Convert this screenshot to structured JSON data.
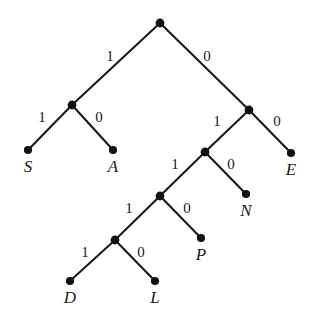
{
  "figure": {
    "kind": "binary-coding-tree",
    "background_color": "#ffffff",
    "line_color": "#1a1a1a",
    "node_color": "#111111",
    "width": 315,
    "height": 328
  },
  "chart_data": {
    "type": "diagram",
    "subtype": "binary-tree",
    "title": "",
    "nodes": [
      {
        "id": "root",
        "kind": "internal",
        "x": 160,
        "y": 23,
        "label": ""
      },
      {
        "id": "n_1",
        "kind": "internal",
        "x": 72,
        "y": 105,
        "label": ""
      },
      {
        "id": "n_0",
        "kind": "internal",
        "x": 249,
        "y": 110,
        "label": ""
      },
      {
        "id": "n_01",
        "kind": "internal",
        "x": 205,
        "y": 152,
        "label": ""
      },
      {
        "id": "n_011",
        "kind": "internal",
        "x": 160,
        "y": 196,
        "label": ""
      },
      {
        "id": "n_0111",
        "kind": "internal",
        "x": 115,
        "y": 240,
        "label": ""
      },
      {
        "id": "leaf_S",
        "kind": "leaf",
        "x": 28,
        "y": 150,
        "label": "S"
      },
      {
        "id": "leaf_A",
        "kind": "leaf",
        "x": 113,
        "y": 150,
        "label": "A"
      },
      {
        "id": "leaf_E",
        "kind": "leaf",
        "x": 291,
        "y": 153,
        "label": "E"
      },
      {
        "id": "leaf_N",
        "kind": "leaf",
        "x": 246,
        "y": 194,
        "label": "N"
      },
      {
        "id": "leaf_P",
        "kind": "leaf",
        "x": 201,
        "y": 238,
        "label": "P"
      },
      {
        "id": "leaf_D",
        "kind": "leaf",
        "x": 70,
        "y": 281,
        "label": "D"
      },
      {
        "id": "leaf_L",
        "kind": "leaf",
        "x": 155,
        "y": 281,
        "label": "L"
      }
    ],
    "edges": [
      {
        "from": "root",
        "to": "n_1",
        "bit": "1",
        "label_x": 110,
        "label_y": 56
      },
      {
        "from": "root",
        "to": "n_0",
        "bit": "0",
        "label_x": 207,
        "label_y": 56
      },
      {
        "from": "n_1",
        "to": "leaf_S",
        "bit": "1",
        "label_x": 42,
        "label_y": 117
      },
      {
        "from": "n_1",
        "to": "leaf_A",
        "bit": "0",
        "label_x": 99,
        "label_y": 117
      },
      {
        "from": "n_0",
        "to": "n_01",
        "bit": "1",
        "label_x": 217,
        "label_y": 121
      },
      {
        "from": "n_0",
        "to": "leaf_E",
        "bit": "0",
        "label_x": 277,
        "label_y": 121
      },
      {
        "from": "n_01",
        "to": "n_011",
        "bit": "1",
        "label_x": 175,
        "label_y": 164
      },
      {
        "from": "n_01",
        "to": "leaf_N",
        "bit": "0",
        "label_x": 231,
        "label_y": 164
      },
      {
        "from": "n_011",
        "to": "n_0111",
        "bit": "1",
        "label_x": 129,
        "label_y": 208
      },
      {
        "from": "n_011",
        "to": "leaf_P",
        "bit": "0",
        "label_x": 187,
        "label_y": 208
      },
      {
        "from": "n_0111",
        "to": "leaf_D",
        "bit": "1",
        "label_x": 85,
        "label_y": 252
      },
      {
        "from": "n_0111",
        "to": "leaf_L",
        "bit": "0",
        "label_x": 141,
        "label_y": 252
      }
    ],
    "codes": [
      {
        "symbol": "S",
        "code": "11"
      },
      {
        "symbol": "A",
        "code": "10"
      },
      {
        "symbol": "E",
        "code": "00"
      },
      {
        "symbol": "N",
        "code": "010"
      },
      {
        "symbol": "P",
        "code": "0110"
      },
      {
        "symbol": "D",
        "code": "011111"
      },
      {
        "symbol": "L",
        "code": "011110"
      }
    ],
    "bit_labels": [
      "1",
      "0",
      "1",
      "0",
      "1",
      "0",
      "1",
      "0",
      "1",
      "0",
      "1",
      "0"
    ],
    "leaf_labels": [
      "S",
      "A",
      "E",
      "N",
      "P",
      "D",
      "L"
    ]
  }
}
